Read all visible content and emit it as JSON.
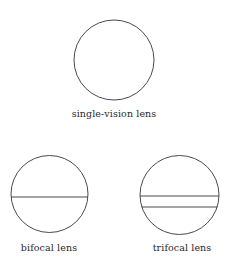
{
  "diagram": {
    "stroke_color": "#4a4a4a",
    "lenses": [
      {
        "id": "single-vision",
        "label": "single-vision lens",
        "center": [
          114,
          60
        ],
        "radius": 40,
        "divider_lines_y": []
      },
      {
        "id": "bifocal",
        "label": "bifocal lens",
        "center": [
          49.5,
          194
        ],
        "radius": 38.5,
        "divider_lines_y": [
          197
        ]
      },
      {
        "id": "trifocal",
        "label": "trifocal lens",
        "center": [
          179.5,
          195
        ],
        "radius": 39.5,
        "divider_lines_y": [
          196,
          207
        ]
      }
    ]
  }
}
